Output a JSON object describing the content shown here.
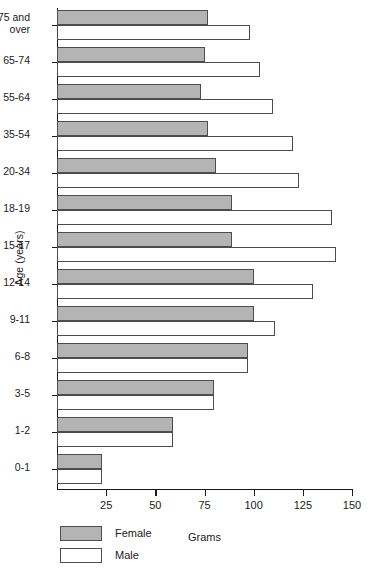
{
  "chart_data": {
    "type": "bar",
    "orientation": "horizontal",
    "title": "",
    "xlabel": "Grams",
    "ylabel": "Age (years)",
    "xlim": [
      0,
      150
    ],
    "xticks": [
      0,
      25,
      50,
      75,
      100,
      125,
      150
    ],
    "xtick_labels": [
      "",
      "25",
      "50",
      "75",
      "100",
      "125",
      "150"
    ],
    "grid": false,
    "legend_position": "bottom-left",
    "categories": [
      "75 and\nover",
      "65-74",
      "55-64",
      "35-54",
      "20-34",
      "18-19",
      "15-17",
      "12-14",
      "9-11",
      "6-8",
      "3-5",
      "1-2",
      "0-1"
    ],
    "series": [
      {
        "name": "Female",
        "color": "#b4b4b4",
        "values": [
          77,
          75,
          73,
          77,
          81,
          89,
          89,
          100,
          100,
          97,
          80,
          59,
          23
        ]
      },
      {
        "name": "Male",
        "color": "#ffffff",
        "values": [
          98,
          103,
          110,
          120,
          123,
          140,
          142,
          130,
          111,
          97,
          80,
          59,
          23
        ]
      }
    ]
  },
  "legend": {
    "items": [
      {
        "label": "Female",
        "swatch": "female"
      },
      {
        "label": "Male",
        "swatch": "male"
      }
    ]
  }
}
